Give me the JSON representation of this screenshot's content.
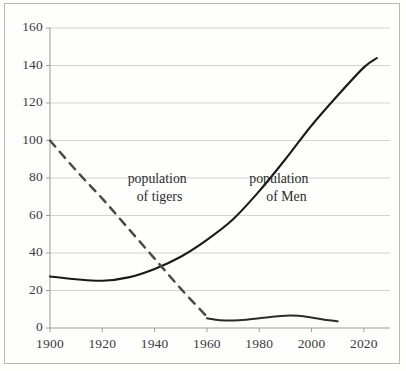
{
  "chart_data": {
    "type": "line",
    "title": "",
    "subtitle": "",
    "xlabel": "",
    "ylabel": "",
    "xlim": [
      1900,
      2030
    ],
    "ylim": [
      0,
      160
    ],
    "grid": true,
    "grid_axis": "y",
    "legend_position": "inline-annotations",
    "xticks": [
      1900,
      1920,
      1940,
      1960,
      1980,
      2000,
      2020
    ],
    "xtick_labels": [
      "1900",
      "1920",
      "1940",
      "1960",
      "1980",
      "2000",
      "2020"
    ],
    "yticks": [
      0,
      20,
      40,
      60,
      80,
      100,
      120,
      140,
      160
    ],
    "ytick_labels": [
      "0",
      "20",
      "40",
      "60",
      "80",
      "100",
      "120",
      "140",
      "160"
    ],
    "annotations": [
      {
        "name": "population-of-tigers-label",
        "line1": "population",
        "line2": "of tigers",
        "x": 1932,
        "y": 80
      },
      {
        "name": "population-of-men-label",
        "line1": "population",
        "line2": "of Men",
        "x": 1985,
        "y": 80
      }
    ],
    "series": [
      {
        "name": "population of Men",
        "style": "solid",
        "color": "#1a1a1a",
        "width": 2.1,
        "x": [
          1900,
          1910,
          1920,
          1930,
          1940,
          1950,
          1960,
          1970,
          1980,
          1990,
          2000,
          2010,
          2020,
          2025
        ],
        "values": [
          27.5,
          26.0,
          25.2,
          27.0,
          31.5,
          38.0,
          47.0,
          58.0,
          73.0,
          90.0,
          108.0,
          124.0,
          139.0,
          144.0
        ]
      },
      {
        "name": "population of tigers (historical trend)",
        "style": "dashed",
        "color": "#4a4a4a",
        "width": 2.5,
        "x": [
          1900,
          1910,
          1920,
          1930,
          1940,
          1950,
          1960
        ],
        "values": [
          100.0,
          84.0,
          69.0,
          53.0,
          37.0,
          21.0,
          6.0
        ]
      },
      {
        "name": "population of tigers (recent)",
        "style": "solid",
        "color": "#2b2b2b",
        "width": 2.0,
        "x": [
          1960,
          1965,
          1970,
          1975,
          1980,
          1985,
          1990,
          1995,
          2000,
          2005,
          2010
        ],
        "values": [
          5.2,
          4.2,
          4.0,
          4.4,
          5.2,
          6.0,
          6.6,
          6.5,
          5.6,
          4.4,
          3.6
        ]
      }
    ]
  }
}
